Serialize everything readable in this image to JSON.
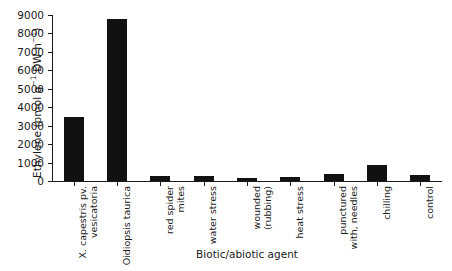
{
  "chart_data": {
    "type": "bar",
    "title": "",
    "xlabel": "Biotic/abiotic agent",
    "ylabel": "Ethylene (pmol g⁻¹ DW h⁻¹)",
    "ylabel_parts": {
      "prefix": "Ethylene (pmol g",
      "sup1": "−1",
      "mid": " DW h",
      "sup2": "−1",
      "suffix": ")"
    },
    "categories": [
      "X. capestris pv. vesicatoria",
      "Oidiopsis taurica",
      "red spider mites",
      "water stress",
      "wounded (rubbing)",
      "heat stress",
      "punctured with, needles",
      "chilling",
      "control"
    ],
    "category_lines": [
      [
        "X. capestris pv.",
        "vesicatoria"
      ],
      [
        "Oidiopsis taurica",
        ""
      ],
      [
        "red spider",
        "mites"
      ],
      [
        "water stress",
        ""
      ],
      [
        "wounded",
        "(rubbing)"
      ],
      [
        "heat stress",
        ""
      ],
      [
        "punctured",
        "with, needles"
      ],
      [
        "chilling",
        ""
      ],
      [
        "control",
        ""
      ]
    ],
    "values": [
      3450,
      8780,
      250,
      260,
      150,
      200,
      390,
      870,
      300
    ],
    "ylim": [
      0,
      9000
    ],
    "yticks": [
      0,
      1000,
      2000,
      3000,
      4000,
      5000,
      6000,
      7000,
      8000,
      9000
    ],
    "ytick_labels": [
      "0",
      "1000",
      "2000",
      "3000",
      "4000",
      "5000",
      "6000",
      "7000",
      "8000",
      "9000"
    ],
    "grid": false,
    "legend": null,
    "bar_color": "#111111",
    "axis_color": "#1a1a1a",
    "background": "#ffffff"
  }
}
